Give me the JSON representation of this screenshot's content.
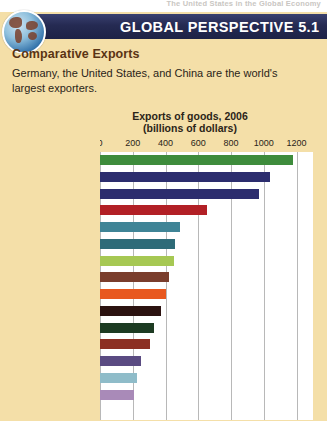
{
  "running_head": "The United States in the Global Economy",
  "banner": {
    "title": "GLOBAL PERSPECTIVE 5.1",
    "icon": "globe-icon",
    "bg_color": "#252a52"
  },
  "feature": {
    "subtitle": "Comparative Exports",
    "body": "Germany, the United States, and China are the world's largest exporters."
  },
  "chart_data": {
    "type": "bar",
    "orientation": "horizontal",
    "title": "Exports of goods, 2006",
    "subtitle": "(billions of dollars)",
    "xlabel": "",
    "ylabel": "",
    "xlim": [
      0,
      1300
    ],
    "ticks": [
      0,
      200,
      400,
      600,
      800,
      1000,
      1200
    ],
    "tick_labels": [
      "0",
      "200",
      "400",
      "600",
      "800",
      "1000",
      "1200"
    ],
    "grid": true,
    "legend": "none",
    "categories": [
      "Germany",
      "United States",
      "China",
      "Japan",
      "France",
      "Netherlands",
      "United Kingdom",
      "Italy",
      "Canada",
      "Belgium",
      "South Korea",
      "Russia",
      "Mexico",
      "Taiwan",
      "Saudi Arabia"
    ],
    "values": [
      1180,
      1040,
      970,
      650,
      490,
      460,
      450,
      420,
      400,
      370,
      330,
      305,
      250,
      225,
      210
    ],
    "colors": [
      "#3e8c3c",
      "#2c2d6e",
      "#2c2d6e",
      "#b22026",
      "#3f8496",
      "#2e6b78",
      "#a6c853",
      "#7a3d2c",
      "#e8581f",
      "#2b1210",
      "#1d3b22",
      "#8c2f22",
      "#5a4b82",
      "#8fbcc9",
      "#a98ab8"
    ]
  }
}
